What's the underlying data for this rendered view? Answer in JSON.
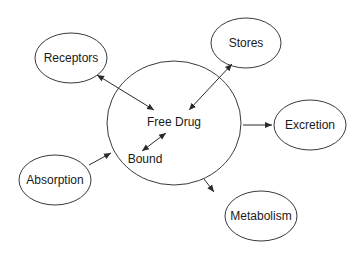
{
  "diagram": {
    "central": {
      "label": "Free Drug",
      "inner_label": "Bound"
    },
    "nodes": {
      "receptors": "Receptors",
      "stores": "Stores",
      "excretion": "Excretion",
      "absorption": "Absorption",
      "metabolism": "Metabolism"
    },
    "edges": [
      {
        "from": "Receptors",
        "to": "Free Drug",
        "direction": "bidirectional"
      },
      {
        "from": "Stores",
        "to": "Free Drug",
        "direction": "bidirectional"
      },
      {
        "from": "Free Drug",
        "to": "Bound",
        "direction": "bidirectional"
      },
      {
        "from": "Free Drug",
        "to": "Excretion",
        "direction": "forward"
      },
      {
        "from": "Absorption",
        "to": "Free Drug",
        "direction": "forward"
      },
      {
        "from": "Free Drug",
        "to": "Metabolism",
        "direction": "forward"
      }
    ]
  }
}
